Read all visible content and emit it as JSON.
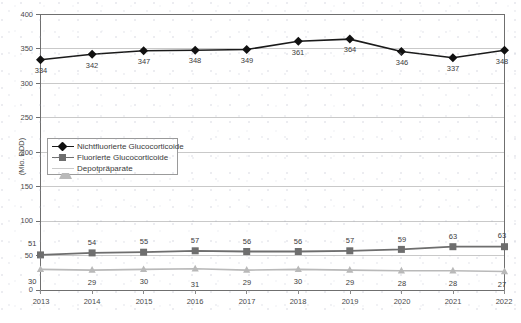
{
  "chart_data": {
    "type": "line",
    "title": "",
    "xlabel": "",
    "ylabel": "(Mio. DDD)",
    "categories": [
      "2013",
      "2014",
      "2015",
      "2016",
      "2017",
      "2018",
      "2019",
      "2020",
      "2021",
      "2022"
    ],
    "ylim": [
      0,
      400
    ],
    "yticks": [
      0,
      50,
      100,
      150,
      200,
      250,
      300,
      350,
      400
    ],
    "grid": "horizontal",
    "legend_position": "center-left inside plot",
    "series": [
      {
        "name": "Nichtfluorierte Glucocorticoide",
        "marker": "diamond",
        "color": "#111111",
        "values": [
          334,
          342,
          347,
          348,
          349,
          361,
          364,
          346,
          337,
          348
        ],
        "labels": [
          "334",
          "342",
          "347",
          "348",
          "349",
          "361",
          "364",
          "346",
          "337",
          "348"
        ]
      },
      {
        "name": "Fluorierte Glucocorticoide",
        "marker": "square",
        "color": "#6e6e6e",
        "values": [
          51,
          54,
          55,
          57,
          56,
          56,
          57,
          59,
          63,
          63
        ],
        "labels": [
          "51",
          "54",
          "55",
          "57",
          "56",
          "56",
          "57",
          "59",
          "63",
          "63"
        ]
      },
      {
        "name": "Depotpräparate",
        "marker": "triangle",
        "color": "#b9b9b9",
        "values": [
          30,
          29,
          30,
          31,
          29,
          30,
          29,
          28,
          28,
          27
        ],
        "labels": [
          "30",
          "29",
          "30",
          "31",
          "29",
          "30",
          "29",
          "28",
          "28",
          "27"
        ]
      }
    ]
  },
  "axes": {
    "y_title": "(Mio. DDD)",
    "y_tick_labels": [
      "400",
      "350",
      "300",
      "250",
      "200",
      "150",
      "100",
      "50",
      "0"
    ],
    "x_tick_labels": [
      "2013",
      "2014",
      "2015",
      "2016",
      "2017",
      "2018",
      "2019",
      "2020",
      "2021",
      "2022"
    ]
  },
  "legend": {
    "items": [
      {
        "label": "Nichtfluorierte Glucocorticoide",
        "marker": "diamond-marker",
        "color": "#111111"
      },
      {
        "label": "Fluorierte Glucocorticoide",
        "marker": "square-marker",
        "color": "#6e6e6e"
      },
      {
        "label": "Depotpräparate",
        "marker": "triangle-marker",
        "color": "#b9b9b9"
      }
    ]
  },
  "colors": {
    "plot_border": "#6f6f6f",
    "gridline": "#c9c9c9",
    "series_1": "#111111",
    "series_2": "#6e6e6e",
    "series_3": "#b9b9b9",
    "background": "#ffffff"
  }
}
